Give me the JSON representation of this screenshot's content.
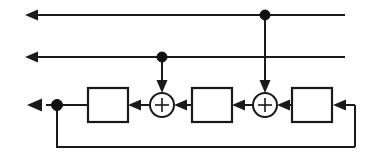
{
  "diagram": {
    "type": "block-diagram",
    "canvas": {
      "width": 376,
      "height": 165,
      "background": "#ffffff"
    },
    "stroke_color": "#1a1a1a",
    "fill_color": "#ffffff",
    "labels": {
      "adder_symbol": "+",
      "block_1": "",
      "block_2": "",
      "block_3": ""
    },
    "nodes": [
      {
        "name": "tap-node-upper",
        "x": 265,
        "y": 15,
        "radius": 5
      },
      {
        "name": "tap-node-middle",
        "x": 162,
        "y": 57,
        "radius": 5
      },
      {
        "name": "tap-node-output",
        "x": 57,
        "y": 105,
        "radius": 5
      }
    ],
    "blocks": [
      {
        "name": "delay-block-1",
        "x": 88,
        "y": 88,
        "width": 40,
        "height": 34
      },
      {
        "name": "delay-block-2",
        "x": 192,
        "y": 88,
        "width": 40,
        "height": 34
      },
      {
        "name": "delay-block-3",
        "x": 292,
        "y": 88,
        "width": 40,
        "height": 34
      }
    ],
    "adders": [
      {
        "name": "adder-1",
        "cx": 162,
        "cy": 105,
        "r": 12
      },
      {
        "name": "adder-2",
        "cx": 265,
        "cy": 105,
        "r": 12
      }
    ],
    "rails": [
      {
        "name": "output-rail-upper",
        "y": 15,
        "from_x": 345,
        "to_x": 27,
        "direction": "left"
      },
      {
        "name": "output-rail-middle",
        "y": 57,
        "from_x": 345,
        "to_x": 27,
        "direction": "left"
      },
      {
        "name": "signal-rail-lower",
        "y": 105,
        "direction": "left"
      }
    ],
    "feedback": {
      "name": "feedback-path",
      "y": 147,
      "left_x": 57,
      "right_x": 355,
      "riser_top_y": 105
    }
  }
}
